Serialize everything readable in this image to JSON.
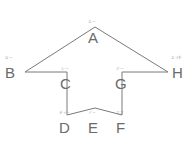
{
  "figure": {
    "type": "geometry-diagram",
    "stroke_color": "#7a7a7a",
    "label_color": "#6b6b6b",
    "mark_color": "#8d8d8d",
    "background_color": "#ffffff",
    "stroke_width": 1,
    "vertices": [
      {
        "id": "A",
        "label": "A",
        "mark": "エー",
        "x": 95,
        "y": 27,
        "label_x": 88,
        "label_y": 30,
        "mark_x": 88,
        "mark_y": 20
      },
      {
        "id": "B",
        "label": "B",
        "mark": "ビー",
        "x": 25,
        "y": 72,
        "label_x": 5,
        "label_y": 65,
        "mark_x": 5,
        "mark_y": 56
      },
      {
        "id": "C",
        "label": "C",
        "mark": "シー",
        "x": 67,
        "y": 72,
        "label_x": 60,
        "label_y": 76,
        "mark_x": 61,
        "mark_y": 67
      },
      {
        "id": "D",
        "label": "D",
        "mark": "ディー",
        "x": 67,
        "y": 115,
        "label_x": 59,
        "label_y": 120,
        "mark_x": 59,
        "mark_y": 111
      },
      {
        "id": "E",
        "label": "E",
        "mark": "イー",
        "x": 95,
        "y": 108,
        "label_x": 88,
        "label_y": 120,
        "mark_x": 88,
        "mark_y": 111
      },
      {
        "id": "F",
        "label": "F",
        "mark": "エフ",
        "x": 122,
        "y": 115,
        "label_x": 116,
        "label_y": 120,
        "mark_x": 116,
        "mark_y": 111
      },
      {
        "id": "G",
        "label": "G",
        "mark": "ジー",
        "x": 122,
        "y": 72,
        "label_x": 115,
        "label_y": 76,
        "mark_x": 116,
        "mark_y": 67
      },
      {
        "id": "H",
        "label": "H",
        "mark": "エイチ",
        "x": 168,
        "y": 72,
        "label_x": 172,
        "label_y": 65,
        "mark_x": 171,
        "mark_y": 56
      }
    ],
    "outline_path": "M 95 27 L 25 72 L 67 72 L 67 115 L 95 108 L 122 115 L 122 72 L 168 72 Z",
    "edges": [
      {
        "from": "A",
        "to": "B"
      },
      {
        "from": "B",
        "to": "C"
      },
      {
        "from": "C",
        "to": "D"
      },
      {
        "from": "D",
        "to": "E"
      },
      {
        "from": "E",
        "to": "F"
      },
      {
        "from": "F",
        "to": "G"
      },
      {
        "from": "G",
        "to": "H"
      },
      {
        "from": "H",
        "to": "A"
      }
    ]
  }
}
